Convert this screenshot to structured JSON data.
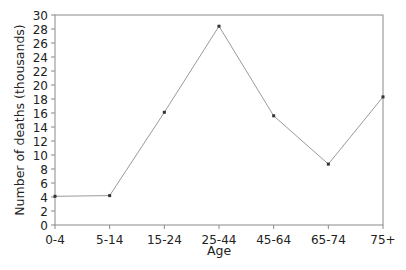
{
  "chart_data": {
    "type": "line",
    "title": "",
    "xlabel": "Age",
    "ylabel": "Number of deaths (thousands)",
    "categories": [
      "0-4",
      "5-14",
      "15-24",
      "25-44",
      "45-64",
      "65-74",
      "75+"
    ],
    "series": [
      {
        "name": "Number of deaths (thousands)",
        "values": [
          4.1,
          4.2,
          16.1,
          28.4,
          15.6,
          8.7,
          18.3
        ]
      }
    ],
    "ylim": [
      0,
      30
    ],
    "yticks": [
      0,
      2,
      4,
      6,
      8,
      10,
      12,
      14,
      16,
      18,
      20,
      22,
      24,
      26,
      28,
      30
    ],
    "grid": false,
    "legend": "none"
  },
  "colors": {
    "line": "#9a9a9a",
    "marker": "#333333",
    "axis": "#8a8a8a",
    "text": "#222222"
  }
}
